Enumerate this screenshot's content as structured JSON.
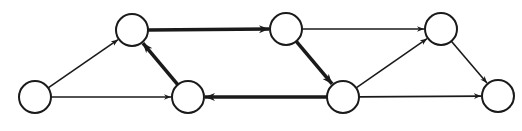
{
  "diagram": {
    "type": "directed-graph",
    "stroke_color": "#1a1a1a",
    "node_fill": "#ffffff",
    "node_radius": 16,
    "nodes": [
      {
        "id": "A",
        "x": 35,
        "y": 97
      },
      {
        "id": "B",
        "x": 132,
        "y": 30
      },
      {
        "id": "C",
        "x": 188,
        "y": 97
      },
      {
        "id": "D",
        "x": 286,
        "y": 29
      },
      {
        "id": "E",
        "x": 343,
        "y": 97
      },
      {
        "id": "F",
        "x": 441,
        "y": 29
      },
      {
        "id": "G",
        "x": 498,
        "y": 96
      }
    ],
    "edges": [
      {
        "from": "A",
        "to": "B",
        "thick": false
      },
      {
        "from": "A",
        "to": "C",
        "thick": false
      },
      {
        "from": "C",
        "to": "B",
        "thick": true
      },
      {
        "from": "B",
        "to": "D",
        "thick": true
      },
      {
        "from": "D",
        "to": "E",
        "thick": true
      },
      {
        "from": "E",
        "to": "C",
        "thick": true
      },
      {
        "from": "D",
        "to": "F",
        "thick": false
      },
      {
        "from": "E",
        "to": "F",
        "thick": false
      },
      {
        "from": "E",
        "to": "G",
        "thick": false
      },
      {
        "from": "F",
        "to": "G",
        "thick": false
      }
    ]
  }
}
